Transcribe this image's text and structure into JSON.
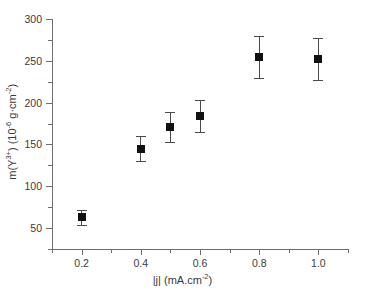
{
  "chart_data": {
    "type": "scatter",
    "title": "",
    "xlabel": "|j| (mA.cm-2)",
    "xlabel_parts": {
      "base": "|j| (mA.cm",
      "exponent": "-2",
      "tail": ")"
    },
    "ylabel": "m(Y3+) (10-6 g.cm-2)",
    "ylabel_parts": {
      "p1": "m(Y",
      "sup1": "3+",
      "p2": ") (10",
      "sup2": "-6",
      "p3": " g",
      "dot": "·",
      "p4": "cm",
      "sup3": "-2",
      "p5": ")"
    },
    "x": [
      0.2,
      0.4,
      0.5,
      0.6,
      0.8,
      1.0
    ],
    "values": [
      63,
      145,
      171,
      184,
      255,
      252
    ],
    "yerr": [
      9,
      15,
      18,
      19,
      25,
      25
    ],
    "xlim": [
      0.1,
      1.1
    ],
    "ylim": [
      25,
      300
    ],
    "xticks": [
      0.2,
      0.4,
      0.6,
      0.8,
      1.0
    ],
    "xtick_labels": [
      "0.2",
      "0.4",
      "0.6",
      "0.8",
      "1.0"
    ],
    "xticks_minor": [
      0.1,
      0.3,
      0.5,
      0.7,
      0.9,
      1.1
    ],
    "yticks": [
      50,
      100,
      150,
      200,
      250,
      300
    ],
    "ytick_labels": [
      "50",
      "100",
      "150",
      "200",
      "250",
      "300"
    ],
    "yticks_minor": [
      25,
      75,
      125,
      175,
      225,
      275
    ],
    "grid": false,
    "legend": "none",
    "marker_style": "filled-square",
    "marker_color": "#111111",
    "errorbar_color": "#4a4a4a",
    "axis_color": "#6e6e6e",
    "background_color": "#ffffff",
    "text_color": "#3a3a3a"
  }
}
